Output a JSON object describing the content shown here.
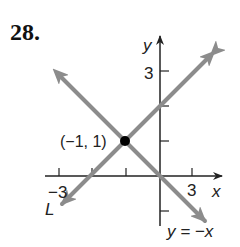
{
  "problem_number": "28.",
  "graph": {
    "axis_labels": {
      "x": "x",
      "y": "y"
    },
    "tick_labels": {
      "x_neg": "−3",
      "x_pos": "3",
      "y_pos": "3"
    },
    "point": {
      "label": "(−1, 1)",
      "x": -1,
      "y": 1
    },
    "lines": [
      {
        "name": "L",
        "label": "L",
        "slope": 1,
        "through": [
          -1,
          1
        ]
      },
      {
        "name": "y=-x",
        "label": "y = −x",
        "slope": -1,
        "through": [
          0,
          0
        ]
      }
    ],
    "colors": {
      "line": "#8c8c8c",
      "axis": "#222222",
      "point": "#000000"
    }
  }
}
